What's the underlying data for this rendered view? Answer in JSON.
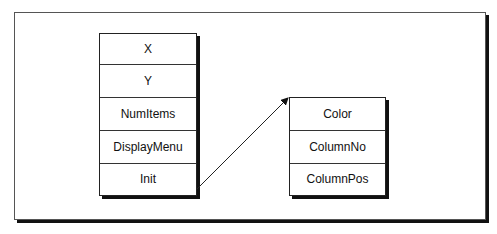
{
  "diagram": {
    "left_box": {
      "fields": [
        "X",
        "Y",
        "NumItems",
        "DisplayMenu",
        "Init"
      ]
    },
    "right_box": {
      "fields": [
        "Color",
        "ColumnNo",
        "ColumnPos"
      ]
    },
    "connector": {
      "from": "Init",
      "to": "Color",
      "type": "arrow"
    }
  }
}
